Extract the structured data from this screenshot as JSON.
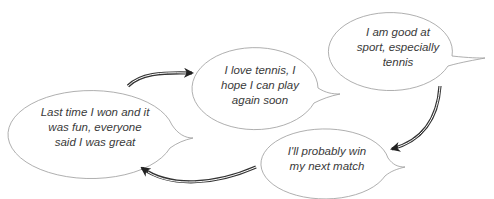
{
  "diagram": {
    "type": "thought-cycle",
    "colors": {
      "bubble_stroke": "#9a9a9a",
      "bubble_fill": "#ffffff",
      "arrow": "#333333",
      "text": "#3a3a3a"
    },
    "bubbles": [
      {
        "id": "good-at-sport",
        "lines": [
          "I am good at",
          "sport, especially",
          "tennis"
        ]
      },
      {
        "id": "love-tennis",
        "lines": [
          "I love tennis, I",
          "hope I can play",
          "again soon"
        ]
      },
      {
        "id": "last-time-won",
        "lines": [
          "Last time I won and it",
          "was fun, everyone",
          "said I was great"
        ]
      },
      {
        "id": "probably-win",
        "lines": [
          "I'll probably win",
          "my next match"
        ]
      }
    ],
    "arrows": [
      {
        "from": "good-at-sport",
        "to": "probably-win"
      },
      {
        "from": "probably-win",
        "to": "last-time-won"
      },
      {
        "from": "last-time-won",
        "to": "love-tennis"
      }
    ]
  }
}
